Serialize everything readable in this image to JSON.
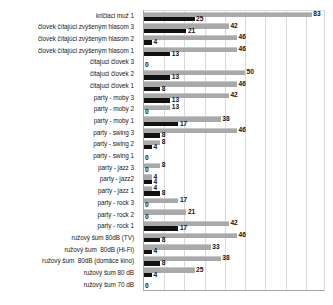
{
  "chart_data": {
    "type": "bar",
    "orientation": "horizontal",
    "title": "",
    "xlabel": "",
    "ylabel": "",
    "xlim": [
      0,
      90
    ],
    "grid": true,
    "legend": "none",
    "gridline_step": 10,
    "colors": {
      "series_gray": "#a9a9a9",
      "series_black": "#111111",
      "gridline": "#d9d9d9",
      "axis": "#a6a6a6",
      "text": "#1a1a1a"
    },
    "categories": [
      "kričiaci muž 1",
      "človek čítajúci zvýšeným hlasom 3",
      "človek čítajúci zvýšeným hlasom 2",
      "človek čítajúci zvýšeným hlasom 1",
      "čitajuci človek 3",
      "čitajuci človek 2",
      "čitajuci človek 1",
      "party - moby 3",
      "party - moby 2",
      "party - moby 1",
      "party - swing 3",
      "party - swing 2",
      "party - swing 1",
      "party - jazz 3",
      "party - jazz2",
      "party - jazz 1",
      "party - rock 3",
      "party - rock 2",
      "party - rock 1",
      "ružový šum 80dB (TV)",
      "ružový šum  80dB (Hi-Fi)",
      "ružový šum  80dB (domáce kino)",
      "ružový šum 80 dB",
      "ružový šum 70 dB"
    ],
    "series": [
      {
        "name": "gray",
        "values": [
          83,
          42,
          46,
          46,
          0,
          50,
          46,
          42,
          13,
          38,
          46,
          8,
          0,
          8,
          4,
          4,
          17,
          21,
          42,
          46,
          33,
          38,
          25,
          0
        ]
      },
      {
        "name": "black",
        "values": [
          25,
          21,
          4,
          13,
          0,
          13,
          8,
          13,
          0,
          17,
          8,
          4,
          0,
          0,
          4,
          8,
          0,
          0,
          17,
          8,
          4,
          8,
          4,
          0
        ]
      }
    ]
  }
}
